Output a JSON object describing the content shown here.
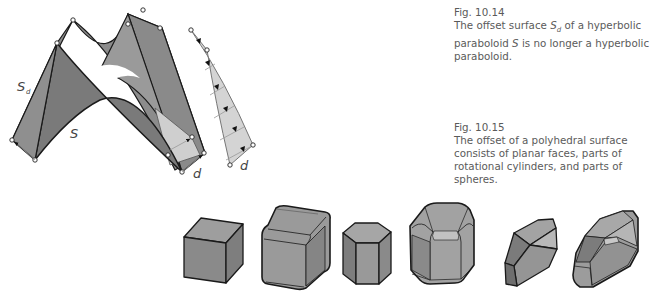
{
  "figures": [
    {
      "id": "fig-10-14",
      "number": "Fig. 10.14",
      "caption_parts": {
        "a": "The offset surface ",
        "b_sym": "S",
        "b_sub": "d",
        "c": " of a hyperbolic paraboloid ",
        "d_sym": "S",
        "e": " is no longer a hyperbolic paraboloid."
      },
      "labels": {
        "offset_surface": "S",
        "offset_sub": "d",
        "surface": "S",
        "distance_main": "d",
        "distance_detail": "d"
      }
    },
    {
      "id": "fig-10-15",
      "number": "Fig. 10.15",
      "caption": "The offset of a polyhedral surface consists of planar faces, parts of rotational cylinders, and parts of spheres.",
      "solids": [
        "cube",
        "cube offset",
        "hexagonal prism",
        "hexagonal prism offset",
        "polyhedron",
        "polyhedron offset"
      ]
    }
  ],
  "colors": {
    "face_dark": "#7d7d7d",
    "face_mid": "#959595",
    "face_light": "#b0b0b0",
    "face_pale": "#d2d2d2",
    "edge": "#1a1a1a",
    "caption_text": "#5a5a5a"
  }
}
